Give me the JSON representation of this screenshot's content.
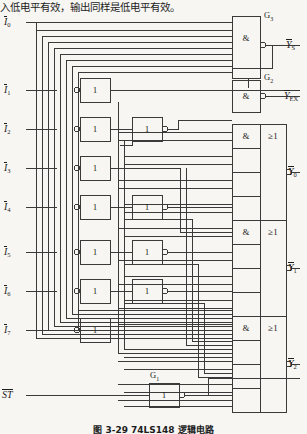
{
  "header": {
    "text": "入低电平有效，输出同样是低电平有效。"
  },
  "caption": {
    "text": "图 3-29  74LS148 逻辑电路"
  },
  "inputs": [
    {
      "name": "I0",
      "label": "I",
      "sub": "0",
      "overbar": true,
      "y": 22
    },
    {
      "name": "I1",
      "label": "I",
      "sub": "1",
      "overbar": true,
      "y": 90
    },
    {
      "name": "I2",
      "label": "I",
      "sub": "2",
      "overbar": true,
      "y": 129
    },
    {
      "name": "I3",
      "label": "I",
      "sub": "3",
      "overbar": true,
      "y": 168
    },
    {
      "name": "I4",
      "label": "I",
      "sub": "4",
      "overbar": true,
      "y": 207
    },
    {
      "name": "I5",
      "label": "I",
      "sub": "5",
      "overbar": true,
      "y": 252
    },
    {
      "name": "I6",
      "label": "I",
      "sub": "6",
      "overbar": true,
      "y": 291
    },
    {
      "name": "I7",
      "label": "I",
      "sub": "7",
      "overbar": true,
      "y": 330
    },
    {
      "name": "ST",
      "label": "ST",
      "sub": "",
      "overbar": true,
      "y": 395
    }
  ],
  "outputs": [
    {
      "name": "YS",
      "label": "Y",
      "sub": "S",
      "overbar": true,
      "y": 45
    },
    {
      "name": "YEX",
      "label": "Y",
      "sub": "EX",
      "overbar": true,
      "y": 96
    },
    {
      "name": "Y0",
      "label": "Y",
      "sub": "0",
      "overbar": true,
      "y": 172
    },
    {
      "name": "Y1",
      "label": "Y",
      "sub": "1",
      "overbar": true,
      "y": 268
    },
    {
      "name": "Y2",
      "label": "Y",
      "sub": "2",
      "overbar": true,
      "y": 364
    }
  ],
  "gate_labels": [
    {
      "name": "G3",
      "text": "G",
      "sub": "3",
      "x": 270,
      "y": 14
    },
    {
      "name": "G2",
      "text": "G",
      "sub": "2",
      "x": 270,
      "y": 76
    },
    {
      "name": "G1",
      "text": "G",
      "sub": "1",
      "x": 150,
      "y": 381
    }
  ],
  "gates": {
    "and_symbol": "&",
    "or_symbol": "≥1",
    "buffer_symbol": "1"
  },
  "colors": {
    "background": "#f7f6f3",
    "line": "#3a3a3a",
    "text": "#1d1d1d"
  },
  "circuit": {
    "title": "74LS148 priority encoder logic circuit",
    "inverter_column_1_count": 7,
    "inverter_column_2_count": 4,
    "and_gate_groups": 3,
    "or_gate_count": 3
  }
}
